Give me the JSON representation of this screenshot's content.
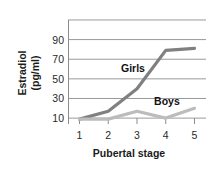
{
  "chart_data": {
    "type": "line",
    "title": "",
    "xlabel": "Pubertal stage",
    "ylabel": "Estradiol (pg/ml)",
    "ylabel_line1": "Estradiol",
    "ylabel_line2": "(pg/ml)",
    "x": [
      1,
      2,
      3,
      4,
      5
    ],
    "xticklabels": [
      "1",
      "2",
      "3",
      "4",
      "5"
    ],
    "yticklabels": [
      "10",
      "30",
      "50",
      "70",
      "90"
    ],
    "yticks": [
      10,
      30,
      50,
      70,
      90
    ],
    "gridlines": [
      10,
      30,
      50,
      70,
      90,
      110
    ],
    "xlim": [
      0.6,
      5.4
    ],
    "ylim": [
      4,
      112
    ],
    "grid": true,
    "legend_position": "inline-labels",
    "series": [
      {
        "name": "Girls",
        "color": "#808080",
        "values": [
          9,
          17,
          40,
          79,
          81
        ],
        "label_x": 3,
        "label_y": 61
      },
      {
        "name": "Boys",
        "color": "#bcbcbc",
        "values": [
          9,
          9,
          17,
          10,
          20
        ],
        "label_x": 4.15,
        "label_y": 27
      }
    ],
    "colors": {
      "girls_line": "#808080",
      "boys_line": "#bcbcbc",
      "gridline": "#9a9a9a",
      "axis": "#8c8c8c",
      "text": "#1b1b1b"
    }
  }
}
